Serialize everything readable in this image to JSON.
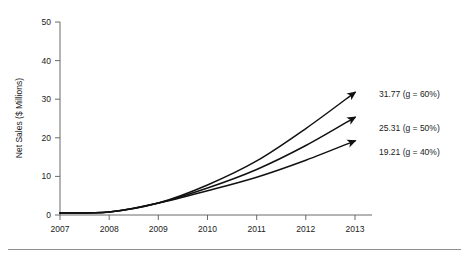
{
  "figure": {
    "background_color": "#ffffff",
    "line_color": "#111111",
    "axis_color": "#5a5a5a",
    "text_color": "#222222",
    "footer_rule_color": "#8f8f8f"
  },
  "chart_data": {
    "type": "line",
    "title": "",
    "xlabel": "",
    "ylabel": "Net Sales ($ Millions)",
    "grid": false,
    "legend_position": "inline-right-annotations",
    "x": [
      2007,
      2008,
      2009,
      2010,
      2011,
      2012,
      2013
    ],
    "categories": [
      "2007",
      "2008",
      "2009",
      "2010",
      "2011",
      "2012",
      "2013"
    ],
    "xlim": [
      2007,
      2013
    ],
    "ylim": [
      0,
      50
    ],
    "ytick_labels": [
      "0",
      "10",
      "20",
      "30",
      "40",
      "50"
    ],
    "ytick_values": [
      0,
      10,
      20,
      30,
      40,
      50
    ],
    "series": [
      {
        "name": "g = 60%",
        "growth_rate_percent": 60,
        "end_value": 31.77,
        "end_label": "31.77 (g = 60%)",
        "values": [
          0.49,
          0.78,
          3.11,
          7.78,
          14.0,
          22.4,
          31.77
        ],
        "arrow_end": true
      },
      {
        "name": "g = 50%",
        "growth_rate_percent": 50,
        "end_value": 25.31,
        "end_label": "25.31 (g = 50%)",
        "values": [
          0.49,
          0.78,
          3.11,
          7.0,
          11.8,
          18.0,
          25.31
        ],
        "arrow_end": true
      },
      {
        "name": "g = 40%",
        "growth_rate_percent": 40,
        "end_value": 19.21,
        "end_label": "19.21 (g = 40%)",
        "values": [
          0.49,
          0.78,
          3.11,
          6.3,
          9.8,
          14.2,
          19.21
        ],
        "arrow_end": true
      }
    ],
    "annotations": [
      {
        "text": "31.77 (g = 60%)",
        "at_x": 2013,
        "at_y": 31.77
      },
      {
        "text": "25.31 (g = 50%)",
        "at_x": 2013,
        "at_y": 25.31
      },
      {
        "text": "19.21 (g = 40%)",
        "at_x": 2013,
        "at_y": 19.21
      }
    ]
  }
}
